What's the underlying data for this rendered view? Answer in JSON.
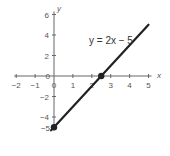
{
  "chart_data": {
    "type": "line",
    "title": "",
    "annotation": "y = 2x − 5",
    "xlabel": "x",
    "ylabel": "y",
    "xlim": [
      -2,
      5
    ],
    "ylim": [
      -5,
      6
    ],
    "grid": false,
    "x_ticks": [
      -2,
      -1,
      0,
      1,
      2,
      3,
      4,
      5
    ],
    "x_tick_labels": [
      "−2",
      "−1",
      "0",
      "1",
      "2",
      "3",
      "4",
      "5"
    ],
    "y_ticks": [
      -4,
      -2,
      0,
      2,
      4,
      6
    ],
    "y_tick_labels": [
      "−4",
      "−2",
      "0",
      "2",
      "4",
      "6"
    ],
    "y_extra_label": "−5",
    "series": [
      {
        "name": "y = 2x − 5",
        "x": [
          -0.15,
          5
        ],
        "y": [
          -5.3,
          5
        ],
        "color": "#222222"
      }
    ],
    "points": [
      {
        "label": "y-intercept",
        "x": 0,
        "y": -5
      },
      {
        "label": "x-intercept",
        "x": 2.5,
        "y": 0
      }
    ]
  },
  "colors": {
    "line": "#222222",
    "axis": "#666666",
    "text": "#555555"
  }
}
